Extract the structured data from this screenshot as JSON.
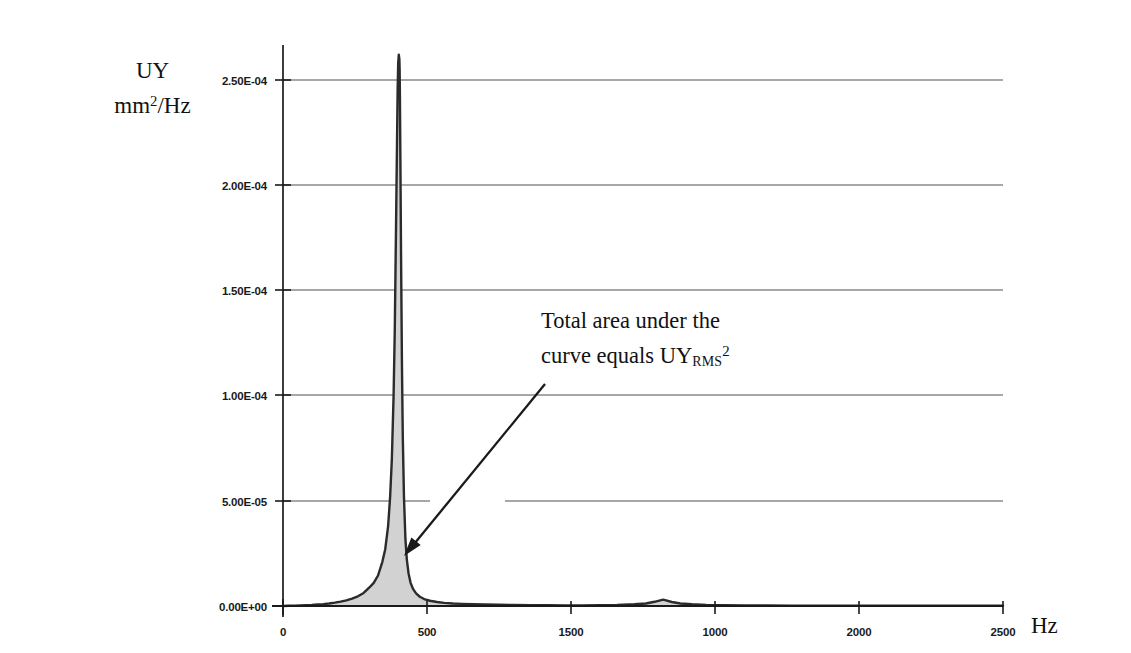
{
  "chart_data": {
    "type": "area",
    "title": "",
    "subtitle": "",
    "xlabel": "Hz",
    "ylabel_line1": "UY",
    "ylabel_line2_prefix": "mm",
    "ylabel_line2_sup": "2",
    "ylabel_line2_suffix": "/Hz",
    "grid": true,
    "legend": "none",
    "xlim": [
      0,
      2500
    ],
    "ylim": [
      0,
      0.000275
    ],
    "xticks": [
      0,
      500,
      1000,
      1500,
      2000,
      2500
    ],
    "xtick_labels": [
      "0",
      "500",
      "1000",
      "1500",
      "2000",
      "2500"
    ],
    "yticks": [
      0,
      5e-05,
      0.0001,
      0.00015,
      0.0002,
      0.00025
    ],
    "ytick_labels": [
      "0.00E+00",
      "5.00E-05",
      "1.00E-04",
      "1.50E-04",
      "2.00E-04",
      "2.50E-04"
    ],
    "fill_color": "#d4d4d4",
    "line_color": "#2b2b2b",
    "grid_color": "#808080",
    "axis_color": "#1a1a1a",
    "peak_frequency_hz": 405,
    "peak_value": 0.000262,
    "secondary_bump_frequency_hz": 1320,
    "secondary_bump_value": 3e-06,
    "x": [
      0,
      20,
      40,
      60,
      80,
      100,
      120,
      140,
      160,
      180,
      200,
      220,
      240,
      260,
      280,
      300,
      315,
      330,
      345,
      355,
      365,
      372,
      378,
      384,
      388,
      392,
      395,
      398,
      400,
      402,
      404,
      405,
      406,
      408,
      410,
      413,
      416,
      420,
      425,
      430,
      436,
      443,
      452,
      462,
      475,
      490,
      510,
      535,
      560,
      590,
      620,
      660,
      700,
      750,
      800,
      860,
      920,
      980,
      1040,
      1100,
      1160,
      1220,
      1260,
      1290,
      1310,
      1320,
      1330,
      1350,
      1380,
      1420,
      1470,
      1530,
      1600,
      1680,
      1770,
      1870,
      1980,
      2090,
      2200,
      2310,
      2420,
      2500
    ],
    "y": [
      0.0,
      1e-07,
      2e-07,
      3e-07,
      4e-07,
      5e-07,
      7e-07,
      9e-07,
      1.2e-06,
      1.6e-06,
      2.1e-06,
      2.7e-06,
      3.5e-06,
      4.6e-06,
      6.2e-06,
      8.8e-06,
      1.1e-05,
      1.45e-05,
      2.1e-05,
      2.7e-05,
      3.8e-05,
      5.2e-05,
      7e-05,
      0.0001,
      0.00013,
      0.000175,
      0.00021,
      0.000245,
      0.000258,
      0.000262,
      0.00026,
      0.000255,
      0.000242,
      0.000205,
      0.000165,
      0.000115,
      8e-05,
      5.2e-05,
      3.2e-05,
      2.2e-05,
      1.55e-05,
      1.1e-05,
      8e-06,
      6e-06,
      4.4e-06,
      3.3e-06,
      2.5e-06,
      1.9e-06,
      1.5e-06,
      1.2e-06,
      1e-06,
      8e-07,
      7e-07,
      6e-07,
      5e-07,
      4e-07,
      4e-07,
      3e-07,
      3e-07,
      4e-07,
      5e-07,
      8e-07,
      1.2e-06,
      2e-06,
      2.7e-06,
      3e-06,
      2.7e-06,
      1.9e-06,
      1.2e-06,
      8e-07,
      5e-07,
      4e-07,
      3e-07,
      3e-07,
      2e-07,
      2e-07,
      2e-07,
      1e-07,
      1e-07,
      1e-07,
      1e-07,
      1e-07
    ]
  },
  "annotation": {
    "line1": "Total area under the",
    "line2_prefix": "curve equals UY",
    "line2_sub": "RMS",
    "line2_sup": "2",
    "arrow_from_x": 545,
    "arrow_from_y": 384,
    "arrow_to_x": 404,
    "arrow_to_y": 556
  }
}
